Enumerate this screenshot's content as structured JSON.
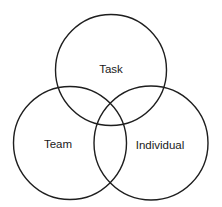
{
  "diagram": {
    "type": "venn",
    "stroke_color": "#1e1e1e",
    "background": "#ffffff",
    "circles": [
      {
        "id": "task",
        "label": "Task",
        "cx": 111,
        "cy": 70,
        "r": 55.5,
        "label_x": 111,
        "label_y": 73
      },
      {
        "id": "team",
        "label": "Team",
        "cx": 70,
        "cy": 143,
        "r": 56.5,
        "label_x": 58,
        "label_y": 148
      },
      {
        "id": "individual",
        "label": "Individual",
        "cx": 151,
        "cy": 143,
        "r": 57,
        "label_x": 160,
        "label_y": 149
      }
    ]
  }
}
